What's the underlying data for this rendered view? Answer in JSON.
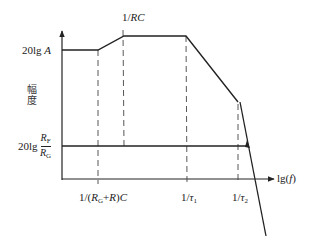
{
  "diagram": {
    "type": "bode-magnitude-plot",
    "y_axis_label": "幅度",
    "x_axis_label": {
      "prefix": "lg(",
      "var": "f",
      "suffix": ")"
    },
    "levels": {
      "upper": {
        "prefix": "20lg ",
        "var": "A"
      },
      "lower": {
        "prefix": "20lg ",
        "num_var": "R",
        "num_sub": "F",
        "den_var": "R",
        "den_sub": "G"
      }
    },
    "top_marker": {
      "num": "1/",
      "var": "RC"
    },
    "x_ticks": [
      {
        "text_prefix": "1/(",
        "var1": "R",
        "sub1": "G",
        "plus": "+",
        "var2": "R",
        "text_suffix": ")",
        "var3": "C"
      },
      {
        "text_prefix": "1/",
        "var": "τ",
        "sub": "1"
      },
      {
        "text_prefix": "1/",
        "var": "τ",
        "sub": "2"
      }
    ],
    "colors": {
      "line": "#222222",
      "dash": "#444444",
      "background": "#ffffff"
    }
  }
}
